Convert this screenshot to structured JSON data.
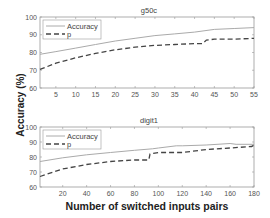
{
  "chart_data": {
    "ylabel": "Accuracy (%)",
    "xlabel": "Number of switched inputs pairs",
    "panels": [
      {
        "type": "line",
        "title": "g50c",
        "xlim": [
          1,
          55
        ],
        "ylim": [
          60,
          100
        ],
        "xticks": [
          5,
          10,
          15,
          20,
          25,
          30,
          35,
          40,
          45,
          50,
          55
        ],
        "yticks": [
          60,
          70,
          80,
          90,
          100
        ],
        "legend": "top-left",
        "grid": false,
        "series": [
          {
            "name": "Accuracy",
            "style": "solid",
            "color": "#aaaaaa",
            "x": [
              1,
              5,
              10,
              15,
              20,
              25,
              30,
              35,
              40,
              45,
              50,
              55
            ],
            "y": [
              79,
              80.5,
              82.5,
              84.5,
              86.5,
              88,
              89.5,
              90.5,
              91.5,
              93,
              93.5,
              94
            ]
          },
          {
            "name": "p",
            "style": "dashed",
            "color": "#444444",
            "x": [
              1,
              5,
              10,
              15,
              20,
              25,
              30,
              35,
              40,
              42,
              43,
              45,
              50,
              55
            ],
            "y": [
              70.5,
              74,
              77,
              79.5,
              81.5,
              83,
              84,
              84.5,
              85,
              85,
              87,
              87.5,
              87.5,
              88
            ]
          }
        ]
      },
      {
        "type": "line",
        "title": "digit1",
        "xlim": [
          1,
          180
        ],
        "ylim": [
          60,
          100
        ],
        "xticks": [
          20,
          40,
          60,
          80,
          100,
          120,
          140,
          160,
          180
        ],
        "yticks": [
          60,
          70,
          80,
          90,
          100
        ],
        "legend": "top-left",
        "grid": false,
        "series": [
          {
            "name": "Accuracy",
            "style": "solid",
            "color": "#aaaaaa",
            "x": [
              1,
              20,
              40,
              60,
              80,
              95,
              100,
              115,
              120,
              140,
              160,
              165,
              180
            ],
            "y": [
              77,
              79.5,
              81.5,
              83,
              84.5,
              85.5,
              86,
              87.5,
              87.5,
              88,
              89,
              88.5,
              88.5
            ]
          },
          {
            "name": "p",
            "style": "dashed",
            "color": "#444444",
            "x": [
              1,
              20,
              40,
              60,
              80,
              92,
              93,
              100,
              120,
              140,
              160,
              178,
              180
            ],
            "y": [
              67,
              72,
              75,
              77,
              78,
              78,
              82,
              83,
              83,
              85,
              86,
              87,
              88
            ]
          }
        ]
      }
    ]
  }
}
